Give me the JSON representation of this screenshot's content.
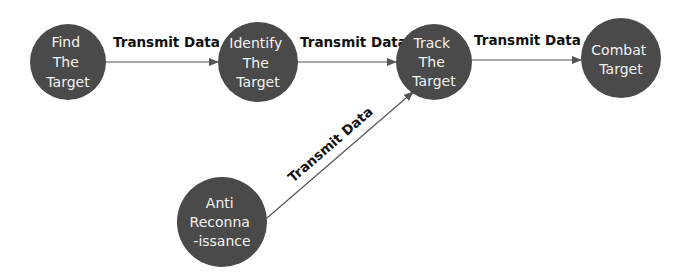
{
  "diagram": {
    "colors": {
      "node_fill": "#4a4a4a",
      "node_text": "#f2f2f2",
      "edge_line": "#555555",
      "edge_text": "#111111",
      "background": "#ffffff"
    },
    "nodes": [
      {
        "id": "find",
        "lines": [
          "Find",
          "The",
          "Target"
        ],
        "cx": 68,
        "cy": 62,
        "r": 38
      },
      {
        "id": "identify",
        "lines": [
          "Identify",
          "The",
          "Target"
        ],
        "cx": 258,
        "cy": 62,
        "r": 40
      },
      {
        "id": "track",
        "lines": [
          "Track",
          "The",
          "Target"
        ],
        "cx": 434,
        "cy": 62,
        "r": 38
      },
      {
        "id": "combat",
        "lines": [
          "Combat",
          "Target"
        ],
        "cx": 621,
        "cy": 58,
        "r": 40
      },
      {
        "id": "anti",
        "lines": [
          "Anti",
          "Reconna",
          "-issance"
        ],
        "cx": 222,
        "cy": 222,
        "r": 45
      }
    ],
    "edges": [
      {
        "from": "find",
        "to": "identify",
        "label": "Transmit Data"
      },
      {
        "from": "identify",
        "to": "track",
        "label": "Transmit Data"
      },
      {
        "from": "track",
        "to": "combat",
        "label": "Transmit Data"
      },
      {
        "from": "anti",
        "to": "track",
        "label": "Transmit Data"
      }
    ]
  }
}
